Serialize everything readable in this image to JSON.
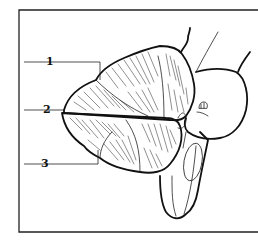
{
  "figure": {
    "type": "anatomical line drawing",
    "labels": [
      {
        "id": 1,
        "text": "1"
      },
      {
        "id": 2,
        "text": "2"
      },
      {
        "id": 3,
        "text": "3"
      }
    ],
    "colors": {
      "background": "#ffffff",
      "ink": "#111111"
    }
  }
}
